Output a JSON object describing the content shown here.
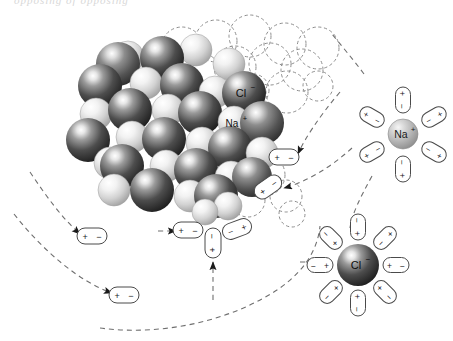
{
  "figure": {
    "title_fragment": "opposing of opposing",
    "background_color": "#ffffff",
    "line_color": "#4a4a4a"
  },
  "labels": {
    "chloride": "Cl",
    "chloride_charge": "−",
    "sodium": "Na",
    "sodium_charge": "+",
    "plus": "+",
    "minus": "−"
  },
  "colors": {
    "chloride_dark": "#3a3a3a",
    "chloride_mid": "#6e6e6e",
    "chloride_light": "#d5d5d5",
    "sodium_light": "#f2f2f2",
    "sodium_mid": "#c9c9c9",
    "sodium_shadow": "#8f8f8f",
    "dash_stroke": "#7d7d7d",
    "arrow_fill": "#222222",
    "dipole_stroke": "#4a4a4a"
  },
  "crystal": {
    "name": "sodium-chloride-lattice",
    "description": "Cubic close-packed array of alternating large chloride and smaller sodium spheres",
    "chloride_count": 23,
    "sodium_count": 22,
    "ghost_circle_count": 16
  },
  "hydrated_sodium": {
    "name": "hydrated-sodium-ion",
    "ion_label": "Na",
    "ion_charge": "+",
    "shell_count": 6,
    "dipole_orientation": "negative end toward ion",
    "center_x": 403,
    "center_y": 134,
    "radius": 15
  },
  "hydrated_chloride": {
    "name": "hydrated-chloride-ion",
    "ion_label": "Cl",
    "ion_charge": "−",
    "shell_count": 8,
    "dipole_orientation": "positive end toward ion",
    "center_x": 358,
    "center_y": 265,
    "radius": 21
  },
  "free_dipoles": [
    {
      "id": "dipole-free-1",
      "x": 92,
      "y": 236,
      "rotation": 0,
      "left": "+",
      "right": "−"
    },
    {
      "id": "dipole-free-2",
      "x": 124,
      "y": 295,
      "rotation": 0,
      "left": "+",
      "right": "−"
    },
    {
      "id": "dipole-surface-1",
      "x": 284,
      "y": 157,
      "rotation": 0,
      "left": "+",
      "right": "−"
    },
    {
      "id": "dipole-surface-2",
      "x": 268,
      "y": 187,
      "rotation": -35,
      "left": "+",
      "right": "−"
    },
    {
      "id": "dipole-surface-3",
      "x": 188,
      "y": 230,
      "rotation": 0,
      "left": "+",
      "right": "−"
    },
    {
      "id": "dipole-surface-4",
      "x": 237,
      "y": 229,
      "rotation": -20,
      "left": "−",
      "right": "+"
    },
    {
      "id": "dipole-surface-5",
      "x": 213,
      "y": 243,
      "rotation": 90,
      "left": "−",
      "right": "+"
    }
  ],
  "flow_arrows": {
    "count": 8,
    "style": "dashed curved trajectory with solid arrowhead",
    "description": "Water dipoles stream toward the crystal face; hydrated ions stream away"
  }
}
